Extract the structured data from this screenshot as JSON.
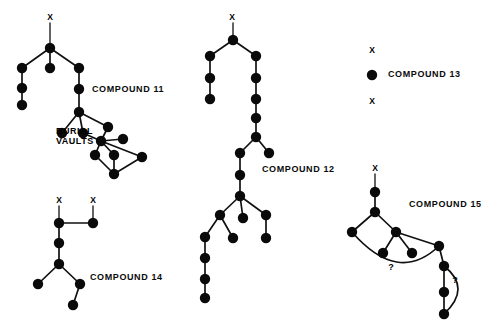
{
  "figure": {
    "title": "",
    "background_color": "#ffffff",
    "node_color": "#0a0a0a",
    "edge_color": "#111111",
    "node_radius": 5.2
  },
  "compounds": [
    {
      "id": "compound-11",
      "label": "COMPOUND  11",
      "label_x": 92,
      "label_y": 92,
      "terminal_markers": [
        {
          "text": "X",
          "x": 50,
          "y": 20
        }
      ],
      "annotations": [
        {
          "text": "BURIAL",
          "x": 56,
          "y": 134
        },
        {
          "text": "VAULTS",
          "x": 56,
          "y": 144
        }
      ],
      "nodes": [
        {
          "id": "n1",
          "x": 50,
          "y": 48
        },
        {
          "id": "n2",
          "x": 22,
          "y": 68
        },
        {
          "id": "n3",
          "x": 50,
          "y": 68
        },
        {
          "id": "n4",
          "x": 79,
          "y": 68
        },
        {
          "id": "n5",
          "x": 22,
          "y": 88
        },
        {
          "id": "n6",
          "x": 22,
          "y": 105
        },
        {
          "id": "n7",
          "x": 79,
          "y": 89
        },
        {
          "id": "n8",
          "x": 79,
          "y": 112
        },
        {
          "id": "n9",
          "x": 62,
          "y": 133
        },
        {
          "id": "n10",
          "x": 83,
          "y": 133
        },
        {
          "id": "n11",
          "x": 108,
          "y": 127
        },
        {
          "id": "n12",
          "x": 101,
          "y": 141
        },
        {
          "id": "n13",
          "x": 123,
          "y": 139
        },
        {
          "id": "n14",
          "x": 95,
          "y": 155
        },
        {
          "id": "n15",
          "x": 114,
          "y": 155
        },
        {
          "id": "n16",
          "x": 142,
          "y": 157
        },
        {
          "id": "n17",
          "x": 114,
          "y": 174
        }
      ],
      "edges": [
        [
          "stem",
          "n1"
        ],
        [
          "n1",
          "n2"
        ],
        [
          "n1",
          "n3"
        ],
        [
          "n1",
          "n4"
        ],
        [
          "n2",
          "n5"
        ],
        [
          "n5",
          "n6"
        ],
        [
          "n4",
          "n7"
        ],
        [
          "n7",
          "n8"
        ],
        [
          "n8",
          "n9"
        ],
        [
          "n8",
          "n10"
        ],
        [
          "n8",
          "n11"
        ],
        [
          "n10",
          "n12"
        ],
        [
          "n11",
          "n12"
        ],
        [
          "n12",
          "n13"
        ],
        [
          "n12",
          "n14"
        ],
        [
          "n12",
          "n15"
        ],
        [
          "n12",
          "n16"
        ],
        [
          "n14",
          "n17"
        ],
        [
          "n15",
          "n17"
        ],
        [
          "n16",
          "n17"
        ]
      ]
    },
    {
      "id": "compound-12",
      "label": "COMPOUND  12",
      "label_x": 262,
      "label_y": 172,
      "terminal_markers": [
        {
          "text": "X",
          "x": 232,
          "y": 20
        }
      ],
      "annotations": [],
      "nodes": [
        {
          "id": "m1",
          "x": 233,
          "y": 40
        },
        {
          "id": "m2",
          "x": 210,
          "y": 56
        },
        {
          "id": "m3",
          "x": 210,
          "y": 78
        },
        {
          "id": "m4",
          "x": 210,
          "y": 99
        },
        {
          "id": "m5",
          "x": 256,
          "y": 56
        },
        {
          "id": "m6",
          "x": 256,
          "y": 78
        },
        {
          "id": "m7",
          "x": 256,
          "y": 99
        },
        {
          "id": "m8",
          "x": 256,
          "y": 118
        },
        {
          "id": "m9",
          "x": 256,
          "y": 137
        },
        {
          "id": "m10",
          "x": 240,
          "y": 153
        },
        {
          "id": "m11",
          "x": 269,
          "y": 153
        },
        {
          "id": "m12",
          "x": 240,
          "y": 175
        },
        {
          "id": "m13",
          "x": 240,
          "y": 196
        },
        {
          "id": "m14",
          "x": 220,
          "y": 215
        },
        {
          "id": "m15",
          "x": 243,
          "y": 218
        },
        {
          "id": "m16",
          "x": 266,
          "y": 215
        },
        {
          "id": "m17",
          "x": 205,
          "y": 237
        },
        {
          "id": "m18",
          "x": 233,
          "y": 238
        },
        {
          "id": "m19",
          "x": 266,
          "y": 238
        },
        {
          "id": "m20",
          "x": 205,
          "y": 258
        },
        {
          "id": "m21",
          "x": 205,
          "y": 279
        },
        {
          "id": "m22",
          "x": 205,
          "y": 298
        }
      ],
      "edges": [
        [
          "stem",
          "m1"
        ],
        [
          "m1",
          "m2"
        ],
        [
          "m2",
          "m3"
        ],
        [
          "m3",
          "m4"
        ],
        [
          "m1",
          "m5"
        ],
        [
          "m5",
          "m6"
        ],
        [
          "m6",
          "m7"
        ],
        [
          "m7",
          "m8"
        ],
        [
          "m8",
          "m9"
        ],
        [
          "m9",
          "m10"
        ],
        [
          "m9",
          "m11"
        ],
        [
          "m10",
          "m12"
        ],
        [
          "m12",
          "m13"
        ],
        [
          "m13",
          "m14"
        ],
        [
          "m13",
          "m15"
        ],
        [
          "m13",
          "m16"
        ],
        [
          "m14",
          "m17"
        ],
        [
          "m14",
          "m18"
        ],
        [
          "m16",
          "m19"
        ],
        [
          "m17",
          "m20"
        ],
        [
          "m20",
          "m21"
        ],
        [
          "m21",
          "m22"
        ]
      ]
    },
    {
      "id": "compound-13",
      "label": "COMPOUND  13",
      "label_x": 388,
      "label_y": 77,
      "terminal_markers": [
        {
          "text": "X",
          "x": 372,
          "y": 53
        },
        {
          "text": "X",
          "x": 372,
          "y": 104
        }
      ],
      "annotations": [],
      "nodes": [
        {
          "id": "p1",
          "x": 372,
          "y": 75
        }
      ],
      "edges": []
    },
    {
      "id": "compound-14",
      "label": "COMPOUND  14",
      "label_x": 90,
      "label_y": 280,
      "terminal_markers": [
        {
          "text": "X",
          "x": 59,
          "y": 203
        },
        {
          "text": "X",
          "x": 93,
          "y": 203
        }
      ],
      "annotations": [],
      "nodes": [
        {
          "id": "q1",
          "x": 59,
          "y": 223
        },
        {
          "id": "q2",
          "x": 93,
          "y": 223
        },
        {
          "id": "q3",
          "x": 59,
          "y": 243
        },
        {
          "id": "q4",
          "x": 59,
          "y": 264
        },
        {
          "id": "q5",
          "x": 38,
          "y": 284
        },
        {
          "id": "q6",
          "x": 80,
          "y": 284
        },
        {
          "id": "q7",
          "x": 73,
          "y": 305
        }
      ],
      "edges": [
        [
          "stem",
          "q1"
        ],
        [
          "stem",
          "q2"
        ],
        [
          "q1",
          "q2"
        ],
        [
          "q1",
          "q3"
        ],
        [
          "q3",
          "q4"
        ],
        [
          "q4",
          "q5"
        ],
        [
          "q4",
          "q6"
        ],
        [
          "q6",
          "q7"
        ]
      ]
    },
    {
      "id": "compound-15",
      "label": "COMPOUND  15",
      "label_x": 409,
      "label_y": 207,
      "terminal_markers": [
        {
          "text": "X",
          "x": 375,
          "y": 171
        }
      ],
      "annotations": [
        {
          "text": "?",
          "x": 391,
          "y": 270
        },
        {
          "text": "?",
          "x": 455,
          "y": 283
        }
      ],
      "nodes": [
        {
          "id": "r1",
          "x": 375,
          "y": 192
        },
        {
          "id": "r2",
          "x": 375,
          "y": 212
        },
        {
          "id": "r3",
          "x": 352,
          "y": 232
        },
        {
          "id": "r4",
          "x": 396,
          "y": 232
        },
        {
          "id": "r5",
          "x": 383,
          "y": 253
        },
        {
          "id": "r6",
          "x": 412,
          "y": 253
        },
        {
          "id": "r7",
          "x": 439,
          "y": 246
        },
        {
          "id": "r8",
          "x": 444,
          "y": 266
        },
        {
          "id": "r9",
          "x": 444,
          "y": 292
        },
        {
          "id": "r10",
          "x": 444,
          "y": 314
        }
      ],
      "edges": [
        [
          "stem",
          "r1"
        ],
        [
          "r1",
          "r2"
        ],
        [
          "r2",
          "r3"
        ],
        [
          "r2",
          "r4"
        ],
        [
          "r4",
          "r5"
        ],
        [
          "r4",
          "r6"
        ],
        [
          "r4",
          "r7"
        ],
        [
          "r7",
          "r8"
        ],
        [
          "r8",
          "r9"
        ],
        [
          "r9",
          "r10"
        ]
      ],
      "curved_edges": [
        {
          "from": "r3",
          "to": "r7",
          "cx": 398,
          "cy": 285
        },
        {
          "from": "r8",
          "to": "r10",
          "cx": 472,
          "cy": 288
        }
      ]
    }
  ]
}
